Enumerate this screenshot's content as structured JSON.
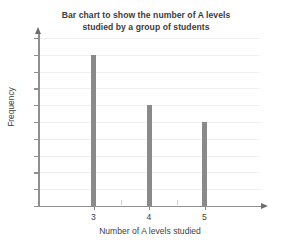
{
  "chart_data": {
    "type": "bar",
    "title": "Bar chart to show the number of A levels studied by a group of students",
    "title_lines": [
      "Bar chart to show the number of A levels",
      "studied by a group of students"
    ],
    "xlabel": "Number of A levels studied",
    "ylabel": "Frequency",
    "categories": [
      "3",
      "4",
      "5"
    ],
    "values": [
      9,
      6,
      5
    ],
    "ylim": [
      0,
      10
    ],
    "ytick_labels": [
      "0",
      "1",
      "2",
      "3",
      "4",
      "5",
      "6",
      "7",
      "8",
      "9",
      "10"
    ],
    "ytick_values": [
      0,
      1,
      2,
      3,
      4,
      5,
      6,
      7,
      8,
      9,
      10
    ],
    "xtick_labels": [
      "3",
      "4",
      "5"
    ],
    "grid": true,
    "legend": "none",
    "bar_color": "#8a8a8a",
    "axis_color": "#8f8f8f",
    "grid_color": "#f0f0f0",
    "text_color": "#3f3f3f",
    "background": "#ffffff"
  }
}
